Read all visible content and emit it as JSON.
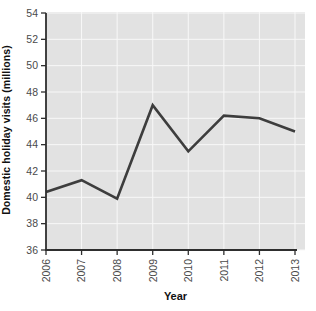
{
  "chart_data": {
    "type": "line",
    "title": "",
    "xlabel": "Year",
    "ylabel": "Domestic holiday visits (millions)",
    "categories": [
      "2006",
      "2007",
      "2008",
      "2009",
      "2010",
      "2011",
      "2012",
      "2013"
    ],
    "values": [
      40.4,
      41.3,
      39.9,
      47.0,
      43.5,
      46.2,
      46.0,
      45.0
    ],
    "series_name": "Domestic holiday visits",
    "ylim": [
      36,
      54
    ],
    "yticks": [
      36,
      38,
      40,
      42,
      44,
      46,
      48,
      50,
      52,
      54
    ],
    "grid": "both",
    "legend": "none",
    "colors": {
      "line": "#3d3d3d",
      "plot_bg": "#e2e2e2",
      "grid": "#f8f8f8",
      "axis": "#2e2e2e",
      "tick_label": "#4a4a4a",
      "axis_title": "#111111",
      "page_bg": "#ffffff"
    }
  }
}
